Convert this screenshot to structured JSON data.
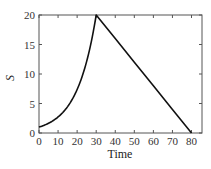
{
  "chart_data": {
    "type": "line",
    "title": "",
    "xlabel": "Time",
    "ylabel": "S",
    "xlim": [
      0,
      85.5
    ],
    "ylim": [
      0,
      20
    ],
    "xticks": [
      0,
      10,
      20,
      30,
      40,
      50,
      60,
      70,
      80
    ],
    "yticks": [
      0,
      5,
      10,
      15,
      20
    ],
    "xtick_labels": [
      "0",
      "10",
      "20",
      "30",
      "40",
      "50",
      "60",
      "70",
      "80"
    ],
    "ytick_labels": [
      "0",
      "5",
      "10",
      "15",
      "20"
    ],
    "grid": false,
    "legend": null,
    "series": [
      {
        "name": "S",
        "color": "#111111",
        "x": [
          0,
          5,
          10,
          15,
          20,
          25,
          30,
          40,
          50,
          60,
          70,
          80
        ],
        "values": [
          1.0,
          1.65,
          2.71,
          4.47,
          7.37,
          12.14,
          20.0,
          16.0,
          12.0,
          8.0,
          4.0,
          0.0
        ]
      }
    ],
    "annotations": "Exponential growth from S≈1 to S=20 over t=0–30, then linear decline to S=0 at t=80"
  }
}
